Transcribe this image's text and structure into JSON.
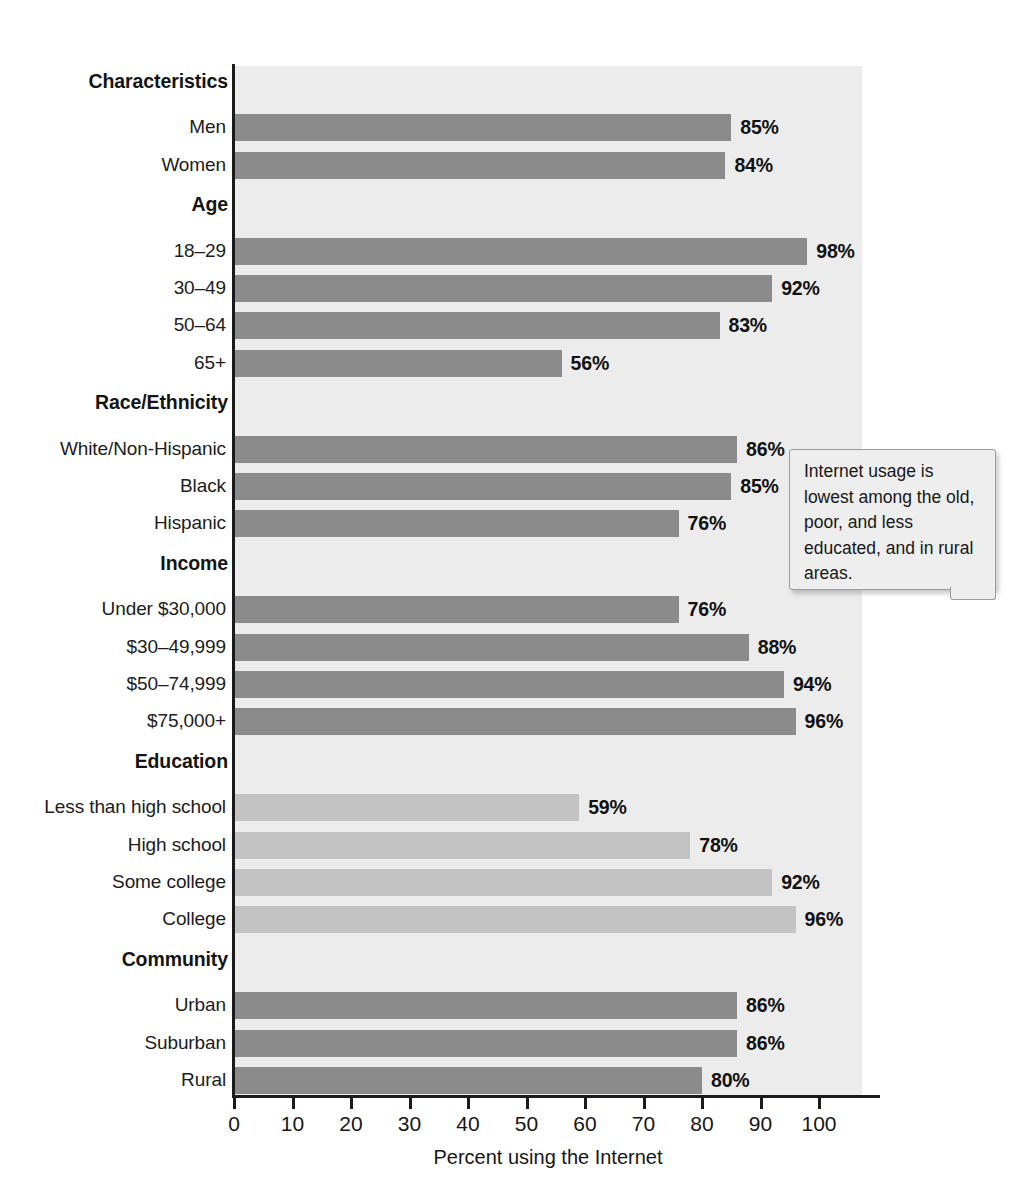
{
  "chart_data": {
    "type": "bar",
    "orientation": "horizontal",
    "title": "",
    "xlabel": "Percent using the Internet",
    "ylabel": "",
    "xlim": [
      0,
      110
    ],
    "xticks": [
      0,
      10,
      20,
      30,
      40,
      50,
      60,
      70,
      80,
      90,
      100
    ],
    "xtick_labels": [
      "0",
      "10",
      "20",
      "30",
      "40",
      "50",
      "60",
      "70",
      "80",
      "90",
      "100"
    ],
    "grid": false,
    "legend": "none",
    "value_suffix": "%",
    "colors": {
      "bar_dark": "#8b8b8b",
      "bar_light": "#c3c3c3",
      "plot_background": "#ececec",
      "axis": "#1b1b1b",
      "text": "#1a1a1a",
      "callout_background": "#eeeeee",
      "callout_border": "#9c9c9c"
    },
    "groups": [
      {
        "heading": "Characteristics",
        "shade": "dark",
        "categories": [
          "Men",
          "Women"
        ],
        "values": [
          85,
          84
        ],
        "labels": [
          "85%",
          "84%"
        ]
      },
      {
        "heading": "Age",
        "shade": "dark",
        "categories": [
          "18–29",
          "30–49",
          "50–64",
          "65+"
        ],
        "values": [
          98,
          92,
          83,
          56
        ],
        "labels": [
          "98%",
          "92%",
          "83%",
          "56%"
        ]
      },
      {
        "heading": "Race/Ethnicity",
        "shade": "dark",
        "categories": [
          "White/Non-Hispanic",
          "Black",
          "Hispanic"
        ],
        "values": [
          86,
          85,
          76
        ],
        "labels": [
          "86%",
          "85%",
          "76%"
        ]
      },
      {
        "heading": "Income",
        "shade": "dark",
        "categories": [
          "Under $30,000",
          "$30–49,999",
          "$50–74,999",
          "$75,000+"
        ],
        "values": [
          76,
          88,
          94,
          96
        ],
        "labels": [
          "76%",
          "88%",
          "94%",
          "96%"
        ]
      },
      {
        "heading": "Education",
        "shade": "light",
        "categories": [
          "Less than high school",
          "High school",
          "Some college",
          "College"
        ],
        "values": [
          59,
          78,
          92,
          96
        ],
        "labels": [
          "59%",
          "78%",
          "92%",
          "96%"
        ]
      },
      {
        "heading": "Community",
        "shade": "dark",
        "categories": [
          "Urban",
          "Suburban",
          "Rural"
        ],
        "values": [
          86,
          86,
          80
        ],
        "labels": [
          "86%",
          "86%",
          "80%"
        ]
      }
    ]
  },
  "callout": {
    "text": "Internet usage is lowest among the old, poor, and less educated, and in rural areas."
  },
  "axis_title": "Percent using the Internet"
}
